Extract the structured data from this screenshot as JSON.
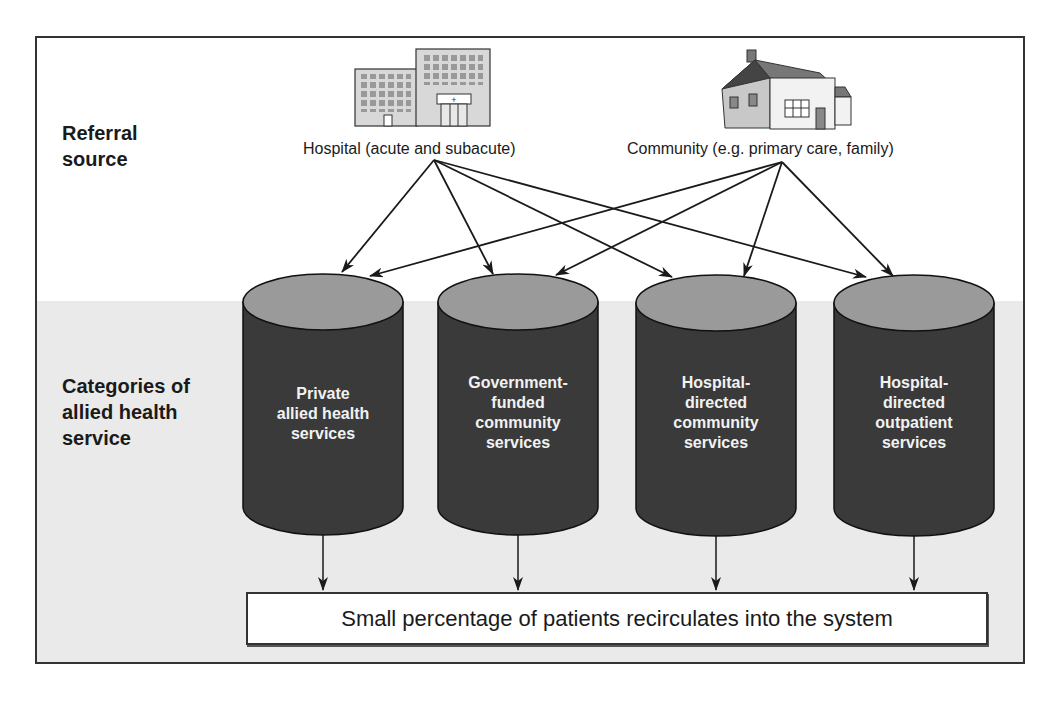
{
  "row_labels": {
    "referral": [
      "Referral",
      "source"
    ],
    "categories": [
      "Categories of",
      "allied health",
      "service"
    ]
  },
  "sources": [
    {
      "id": "hospital",
      "label": "Hospital (acute and subacute)",
      "icon": "hospital-building-icon"
    },
    {
      "id": "community",
      "label": "Community (e.g. primary care, family)",
      "icon": "house-icon"
    }
  ],
  "services": [
    {
      "lines": [
        "Private",
        "allied health",
        "services"
      ]
    },
    {
      "lines": [
        "Government-",
        "funded",
        "community",
        "services"
      ]
    },
    {
      "lines": [
        "Hospital-",
        "directed",
        "community",
        "services"
      ]
    },
    {
      "lines": [
        "Hospital-",
        "directed",
        "outpatient",
        "services"
      ]
    }
  ],
  "outcome": {
    "label": "Small percentage of patients recirculates into the system"
  },
  "colors": {
    "cylinder_body": "#3a3a3a",
    "cylinder_top": "#9a9a9a",
    "band": "#eaeaea",
    "line": "#1a1a1a"
  }
}
